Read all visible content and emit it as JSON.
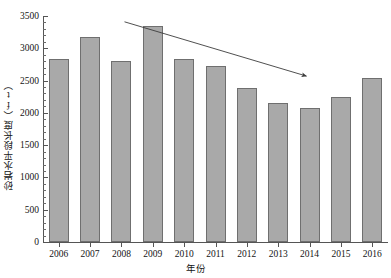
{
  "chart_data": {
    "type": "bar",
    "title": "",
    "xlabel": "年份",
    "ylabel": "砂岩水平段长度（ft）",
    "categories": [
      "2006",
      "2007",
      "2008",
      "2009",
      "2010",
      "2011",
      "2012",
      "2013",
      "2014",
      "2015",
      "2016"
    ],
    "values": [
      2840,
      3180,
      2810,
      3350,
      2830,
      2720,
      2380,
      2150,
      2080,
      2240,
      2540
    ],
    "ylim": [
      0,
      3500
    ],
    "ytick_labels": [
      "0",
      "500",
      "1000",
      "1500",
      "2000",
      "2500",
      "3000",
      "3500"
    ],
    "ytick_values": [
      0,
      500,
      1000,
      1500,
      2000,
      2500,
      3000,
      3500
    ],
    "minor_tick_interval": 100,
    "grid": false,
    "legend": null,
    "annotations": [
      {
        "name": "declining-trend-arrow",
        "type": "arrow",
        "from": {
          "x": 2008.1,
          "y": 3410
        },
        "to": {
          "x": 2013.9,
          "y": 2570
        }
      }
    ],
    "series_color": "#a9a9a9",
    "series_edge_color": "#6f6f6f",
    "axis_color": "#555555",
    "annotation_color": "#3c3c3c"
  }
}
